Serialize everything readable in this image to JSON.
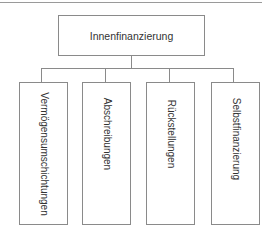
{
  "diagram": {
    "root": {
      "label": "Innenfinanzierung"
    },
    "children": [
      {
        "label": "Vermögensumschichtungen"
      },
      {
        "label": "Abschreibungen"
      },
      {
        "label": "Rückstellungen"
      },
      {
        "label": "Selbstfinanzierung"
      }
    ]
  },
  "colors": {
    "line": "#8a8a8a",
    "background": "#ffffff",
    "text": "#333333"
  }
}
